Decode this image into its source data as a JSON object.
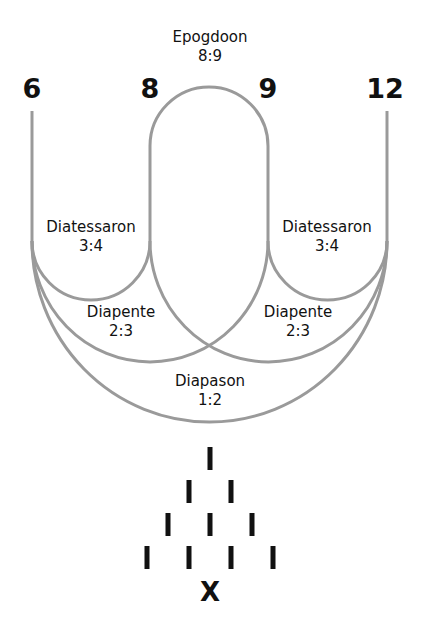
{
  "diagram": {
    "type": "harmonic-intervals",
    "line_color": "#999999",
    "text_color": "#111111",
    "numbers": [
      {
        "label": "6",
        "x": 32
      },
      {
        "label": "8",
        "x": 150
      },
      {
        "label": "9",
        "x": 268
      },
      {
        "label": "12",
        "x": 387
      }
    ],
    "intervals": {
      "epogdoon": {
        "name": "Epogdoon",
        "ratio": "8:9"
      },
      "diatessaron_left": {
        "name": "Diatessaron",
        "ratio": "3:4"
      },
      "diatessaron_right": {
        "name": "Diatessaron",
        "ratio": "3:4"
      },
      "diapente_left": {
        "name": "Diapente",
        "ratio": "2:3"
      },
      "diapente_right": {
        "name": "Diapente",
        "ratio": "2:3"
      },
      "diapason": {
        "name": "Diapason",
        "ratio": "1:2"
      }
    },
    "tetractys": {
      "rows": [
        1,
        2,
        3,
        4
      ],
      "mark": "I",
      "footer": "X"
    }
  }
}
